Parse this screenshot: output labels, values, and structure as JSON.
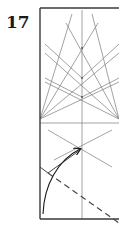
{
  "step": {
    "number": "17"
  },
  "diagram": {
    "type": "origami-fold-diagram",
    "colors": {
      "frame": "#3a3a3a",
      "crease": "#8a8a8a",
      "arrow": "#1a1a1a",
      "valley_fold": "#444444"
    },
    "elements": [
      "paper-outline",
      "center-vertical-crease",
      "horizontal-crease",
      "radiating-creases",
      "lower-x-crease",
      "curved-fold-arrow",
      "valley-fold-dashed-line"
    ]
  }
}
